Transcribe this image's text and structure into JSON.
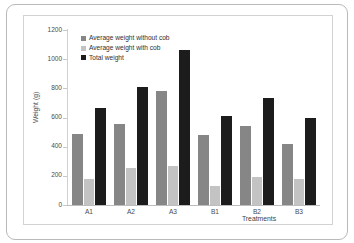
{
  "chart_data": {
    "type": "bar",
    "title": "",
    "subtitle": "",
    "xlabel": "Treatments",
    "ylabel": "Weight (g)",
    "categories": [
      "A1",
      "A2",
      "A3",
      "B1",
      "B2",
      "B3"
    ],
    "ylim": [
      0,
      1200
    ],
    "yticks": [
      0,
      200,
      400,
      600,
      800,
      1000,
      1200
    ],
    "ytick_labels": [
      "0",
      "200",
      "400",
      "600",
      "800",
      "1000",
      "1200"
    ],
    "grid": false,
    "legend_position": "top-left",
    "series": [
      {
        "name": "Average weight without cob",
        "color": "#868686",
        "values": [
          490,
          555,
          785,
          480,
          545,
          420
        ]
      },
      {
        "name": "Average weight with cob",
        "color": "#c3c3c3",
        "values": [
          180,
          255,
          270,
          130,
          190,
          175
        ]
      },
      {
        "name": "Total weight",
        "color": "#1c1c1c",
        "values": [
          665,
          810,
          1060,
          610,
          735,
          595
        ]
      }
    ]
  },
  "legend": {
    "items": [
      {
        "label": "Average weight without cob",
        "swatch": "legend-swatch-without-cob"
      },
      {
        "label": "Average weight with cob",
        "swatch": "legend-swatch-with-cob"
      },
      {
        "label": "Total weight",
        "swatch": "legend-swatch-total"
      }
    ]
  },
  "axes": {
    "y_title": "Weight (g)",
    "x_title": "Treatments"
  }
}
